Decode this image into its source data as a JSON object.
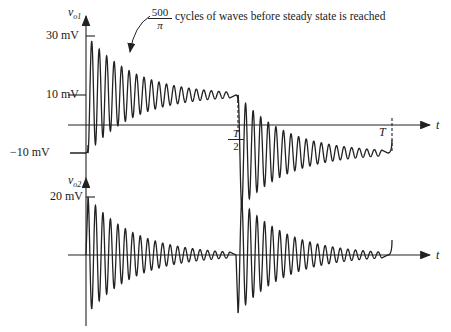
{
  "figure": {
    "top_plot": {
      "y_label": "v",
      "y_label_sub": "o1",
      "x_label": "t",
      "ticks": {
        "y30": "30 mV",
        "y10": "10 mV",
        "yneg10": "−10 mV"
      },
      "x_ticks": {
        "half_num": "T",
        "half_den": "2",
        "full": "T"
      },
      "annotation": {
        "num": "500",
        "den": "π",
        "text": "cycles of waves before steady state is reached"
      }
    },
    "bottom_plot": {
      "y_label": "v",
      "y_label_sub": "o2",
      "x_label": "t",
      "ticks": {
        "y20": "20 mV"
      }
    }
  },
  "chart_data": [
    {
      "type": "line",
      "title": "v_o1 vs t",
      "ylabel": "v_o1",
      "xlabel": "t",
      "y_ticks": [
        "30 mV",
        "10 mV",
        "-10 mV"
      ],
      "x_ticks": [
        "T/2",
        "T"
      ],
      "description": "Starts at -10 mV, at t=0 steps into damped oscillation (first peak ~28 mV) settling to 10 mV; at T/2 switches into damped oscillation settling back to -10 mV; at T begins rising again.",
      "annotation": "500/π cycles of waves before steady state is reached",
      "segments": [
        {
          "t_start": "0",
          "t_end": "T/2",
          "initial": -10,
          "steady": 10,
          "first_peak": 28
        },
        {
          "t_start": "T/2",
          "t_end": "T",
          "initial": 10,
          "steady": -10,
          "first_trough": -30
        }
      ]
    },
    {
      "type": "line",
      "title": "v_o2 vs t",
      "ylabel": "v_o2",
      "xlabel": "t",
      "y_ticks": [
        "20 mV"
      ],
      "description": "Damped oscillation about 0 starting at ~20 mV at t=0 decaying to 0; at T/2 a negative-going damped oscillation (~-20 mV) decays to 0; at T begins again.",
      "segments": [
        {
          "t_start": "0",
          "t_end": "T/2",
          "amplitude_start": 20,
          "steady": 0
        },
        {
          "t_start": "T/2",
          "t_end": "T",
          "amplitude_start": -20,
          "steady": 0
        }
      ]
    }
  ]
}
